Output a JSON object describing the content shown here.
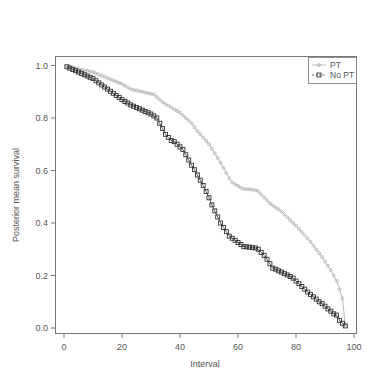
{
  "chart_data": {
    "type": "line",
    "title": "",
    "xlabel": "Interval",
    "ylabel": "Posterior mean survival",
    "xlim": [
      0,
      100
    ],
    "ylim": [
      0.0,
      1.0
    ],
    "xticks": [
      0,
      20,
      40,
      60,
      80,
      100
    ],
    "yticks": [
      0.0,
      0.2,
      0.4,
      0.6,
      0.8,
      1.0
    ],
    "ytick_labels": [
      "0.0",
      "0.2",
      "0.4",
      "0.6",
      "0.8",
      "1.0"
    ],
    "grid": false,
    "legend_position": "top-right",
    "x": [
      1,
      2,
      3,
      4,
      5,
      6,
      7,
      8,
      9,
      10,
      11,
      12,
      13,
      14,
      15,
      16,
      17,
      18,
      19,
      20,
      21,
      22,
      23,
      24,
      25,
      26,
      27,
      28,
      29,
      30,
      31,
      32,
      33,
      34,
      35,
      36,
      37,
      38,
      39,
      40,
      41,
      42,
      43,
      44,
      45,
      46,
      47,
      48,
      49,
      50,
      51,
      52,
      53,
      54,
      55,
      56,
      57,
      58,
      59,
      60,
      61,
      62,
      63,
      64,
      65,
      66,
      67,
      68,
      69,
      70,
      71,
      72,
      73,
      74,
      75,
      76,
      77,
      78,
      79,
      80,
      81,
      82,
      83,
      84,
      85,
      86,
      87,
      88,
      89,
      90,
      91,
      92,
      93,
      94,
      95,
      96,
      97
    ],
    "series": [
      {
        "name": "PT",
        "color": "#aaaaaa",
        "marker": "circle-small",
        "values": [
          0.997,
          0.995,
          0.992,
          0.99,
          0.987,
          0.985,
          0.982,
          0.98,
          0.977,
          0.975,
          0.97,
          0.966,
          0.961,
          0.957,
          0.952,
          0.948,
          0.943,
          0.939,
          0.934,
          0.93,
          0.923,
          0.917,
          0.91,
          0.907,
          0.905,
          0.902,
          0.9,
          0.897,
          0.895,
          0.892,
          0.89,
          0.88,
          0.87,
          0.86,
          0.853,
          0.847,
          0.84,
          0.833,
          0.827,
          0.82,
          0.81,
          0.8,
          0.79,
          0.78,
          0.765,
          0.75,
          0.738,
          0.725,
          0.713,
          0.7,
          0.683,
          0.665,
          0.648,
          0.63,
          0.61,
          0.59,
          0.57,
          0.554,
          0.547,
          0.541,
          0.534,
          0.53,
          0.529,
          0.528,
          0.527,
          0.525,
          0.52,
          0.509,
          0.497,
          0.486,
          0.475,
          0.467,
          0.459,
          0.452,
          0.444,
          0.433,
          0.422,
          0.411,
          0.4,
          0.39,
          0.378,
          0.365,
          0.353,
          0.341,
          0.328,
          0.314,
          0.299,
          0.285,
          0.27,
          0.253,
          0.237,
          0.22,
          0.2,
          0.18,
          0.147,
          0.113,
          0.01
        ]
      },
      {
        "name": "No PT",
        "color": "#333333",
        "marker": "square-open",
        "values": [
          0.995,
          0.99,
          0.985,
          0.98,
          0.975,
          0.97,
          0.965,
          0.96,
          0.955,
          0.95,
          0.942,
          0.934,
          0.926,
          0.918,
          0.91,
          0.902,
          0.894,
          0.886,
          0.878,
          0.87,
          0.863,
          0.857,
          0.85,
          0.845,
          0.84,
          0.835,
          0.83,
          0.825,
          0.82,
          0.815,
          0.808,
          0.8,
          0.78,
          0.76,
          0.738,
          0.726,
          0.714,
          0.71,
          0.7,
          0.69,
          0.68,
          0.66,
          0.64,
          0.62,
          0.603,
          0.583,
          0.563,
          0.543,
          0.52,
          0.496,
          0.469,
          0.446,
          0.423,
          0.4,
          0.383,
          0.367,
          0.35,
          0.342,
          0.334,
          0.326,
          0.318,
          0.31,
          0.309,
          0.308,
          0.306,
          0.305,
          0.3,
          0.288,
          0.277,
          0.262,
          0.245,
          0.228,
          0.224,
          0.218,
          0.213,
          0.207,
          0.202,
          0.196,
          0.19,
          0.179,
          0.169,
          0.158,
          0.148,
          0.137,
          0.128,
          0.119,
          0.11,
          0.1,
          0.093,
          0.083,
          0.073,
          0.064,
          0.054,
          0.049,
          0.029,
          0.018,
          0.008
        ]
      }
    ]
  },
  "legend": {
    "items": [
      {
        "label": "PT"
      },
      {
        "label": "No PT"
      }
    ]
  },
  "axes": {
    "x_title": "Interval",
    "y_title": "Posterior mean survival",
    "x_tick_labels": [
      "0",
      "20",
      "40",
      "60",
      "80",
      "100"
    ],
    "y_tick_labels": [
      "0.0",
      "0.2",
      "0.4",
      "0.6",
      "0.8",
      "1.0"
    ]
  }
}
